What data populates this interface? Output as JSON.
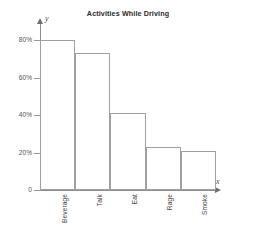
{
  "chart_data": {
    "type": "bar",
    "title": "Activities While Driving",
    "xlabel": "x",
    "ylabel": "y",
    "categories": [
      "Beverage",
      "Talk",
      "Eat",
      "Rage",
      "Smoke"
    ],
    "values": [
      80,
      73,
      41,
      23,
      21
    ],
    "ylim": [
      0,
      80
    ],
    "yticks": [
      0,
      20,
      40,
      60,
      80
    ],
    "ytick_labels": [
      "0",
      "20%",
      "40%",
      "60%",
      "80%"
    ],
    "grid": false,
    "legend": false,
    "series": [
      {
        "name": "Percent of drivers",
        "values": [
          80,
          73,
          41,
          23,
          21
        ]
      }
    ],
    "colors": {
      "bar_fill": "#ffffff",
      "bar_stroke": "#a0a0a0",
      "axis": "#8e8e8e",
      "text": "#454545",
      "background": "#ffffff"
    }
  }
}
